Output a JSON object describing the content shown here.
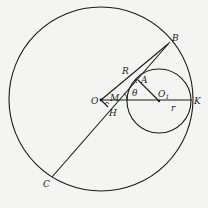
{
  "diagram": {
    "type": "geometry",
    "colors": {
      "stroke": "#1a1a1a",
      "background": "#f4f4f2"
    },
    "labels": {
      "B": "B",
      "C": "C",
      "R": "R",
      "A": "A",
      "O": "O",
      "M": "M",
      "theta": "θ",
      "O1": "O",
      "O1_sub": "1",
      "K": "K",
      "r": "r",
      "H": "H"
    },
    "points": {
      "O": [
        101,
        100
      ],
      "O1": [
        158,
        100
      ],
      "K": [
        192,
        100
      ],
      "B": [
        169,
        43
      ],
      "C": [
        52,
        176
      ],
      "A": [
        140,
        80
      ],
      "M": [
        118,
        100
      ],
      "H": [
        107,
        107
      ]
    },
    "circles": [
      {
        "name": "big-circle",
        "center": "O",
        "radius": 92
      },
      {
        "name": "small-circle",
        "center": "O1",
        "radius": 32
      }
    ]
  }
}
